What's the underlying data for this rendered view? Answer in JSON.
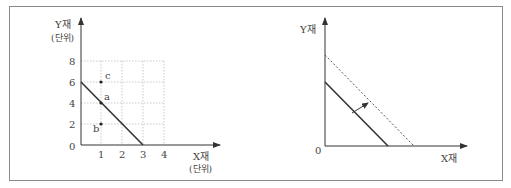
{
  "left_panel": {
    "y_axis_title": "Y재",
    "y_axis_unit": "(단위)",
    "x_axis_title": "X재",
    "x_axis_unit": "(단위)",
    "origin_label": "0",
    "x_ticks": [
      "1",
      "2",
      "3",
      "4"
    ],
    "y_ticks": [
      "2",
      "4",
      "6",
      "8"
    ],
    "points": [
      {
        "label": "c",
        "x": 1,
        "y": 6
      },
      {
        "label": "a",
        "x": 1,
        "y": 4
      },
      {
        "label": "b",
        "x": 1,
        "y": 2
      }
    ],
    "line": {
      "from": [
        0,
        6
      ],
      "to": [
        3,
        0
      ],
      "style": "solid"
    }
  },
  "right_panel": {
    "y_axis_title": "Y재",
    "x_axis_title": "X재",
    "origin_label": "0",
    "original_line_style": "solid",
    "shifted_line_style": "dotted",
    "shift_direction": "outward"
  },
  "colors": {
    "line": "#333333",
    "grid": "#bdbdbd",
    "frame": "#8a8a8a"
  }
}
